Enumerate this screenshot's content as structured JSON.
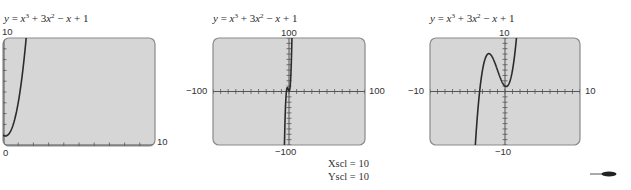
{
  "chart_data": [
    {
      "type": "line",
      "title": "y = x^3 + 3x^2 - x + 1",
      "function": "x^3 + 3x^2 - x + 1",
      "xlim": [
        0,
        10
      ],
      "ylim": [
        0,
        10
      ],
      "xscl": 1,
      "yscl": 1,
      "tick_labels": {
        "ymax": "10",
        "xmin": "0",
        "xmax": "10"
      },
      "box": {
        "left": 3,
        "top": 38,
        "right": 155,
        "bottom": 146
      }
    },
    {
      "type": "line",
      "title": "y = x^3 + 3x^2 - x + 1",
      "function": "x^3 + 3x^2 - x + 1",
      "xlim": [
        -100,
        100
      ],
      "ylim": [
        -100,
        100
      ],
      "xscl": 10,
      "yscl": 10,
      "tick_labels": {
        "ymax": "100",
        "ymin": "−100",
        "xmin": "−100",
        "xmax": "100"
      },
      "box": {
        "left": 213,
        "top": 38,
        "right": 365,
        "bottom": 145
      }
    },
    {
      "type": "line",
      "title": "y = x^3 + 3x^2 - x + 1",
      "function": "x^3 + 3x^2 - x + 1",
      "xlim": [
        -10,
        10
      ],
      "ylim": [
        -10,
        10
      ],
      "xscl": 1,
      "yscl": 1,
      "tick_labels": {
        "ymax": "10",
        "ymin": "−10",
        "xmin": "−10",
        "xmax": "10"
      },
      "box": {
        "left": 430,
        "top": 38,
        "right": 580,
        "bottom": 145
      }
    }
  ],
  "graphs": [
    {
      "title": {
        "y": "y",
        "eq": " = ",
        "x3": "x",
        "p3": "3",
        "plus1": " + 3",
        "x2": "x",
        "p2": "2",
        "minus": " − ",
        "x1": "x",
        "tail": " + 1"
      },
      "labels": {
        "ymax": "10",
        "xmin": "0",
        "xmax": "10"
      }
    },
    {
      "title": {
        "y": "y",
        "eq": " = ",
        "x3": "x",
        "p3": "3",
        "plus1": " + 3",
        "x2": "x",
        "p2": "2",
        "minus": " − ",
        "x1": "x",
        "tail": " + 1"
      },
      "labels": {
        "ymax": "100",
        "ymin": "−100",
        "xmin": "−100",
        "xmax": "100"
      }
    },
    {
      "title": {
        "y": "y",
        "eq": " = ",
        "x3": "x",
        "p3": "3",
        "plus1": " + 3",
        "x2": "x",
        "p2": "2",
        "minus": " − ",
        "x1": "x",
        "tail": " + 1"
      },
      "labels": {
        "ymax": "10",
        "ymin": "−10",
        "xmin": "−10",
        "xmax": "10"
      }
    }
  ],
  "scale_note": {
    "xscl": "Xscl = 10",
    "yscl": "Yscl = 10"
  },
  "colors": {
    "screen_fill": "#d6d6d6",
    "screen_border": "#8a8a8a",
    "curve": "#2b2b2b",
    "axis": "#555555"
  },
  "icons": {
    "pen": "stylus-pointer-icon"
  }
}
